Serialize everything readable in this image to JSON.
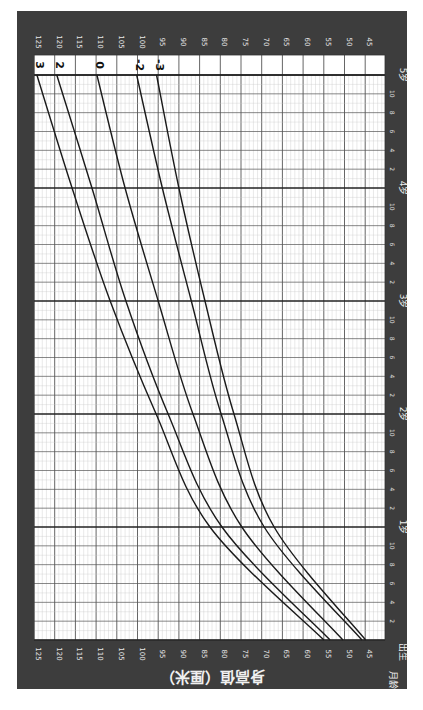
{
  "chart_data": {
    "type": "line",
    "title": "身高值（厘米）",
    "orientation": "rotated 90° clockwise (height axis horizontal, age axis vertical)",
    "xlabel": "月龄",
    "ylabel": "身高值（厘米）",
    "age_axis": {
      "start_label": "出生",
      "year_labels": [
        "1岁",
        "2岁",
        "3岁",
        "4岁",
        "5岁"
      ],
      "month_ticks": [
        "2",
        "4",
        "6",
        "8",
        "10"
      ],
      "range_months": [
        0,
        60
      ]
    },
    "height_axis": {
      "ticks": [
        125,
        120,
        115,
        110,
        105,
        100,
        95,
        90,
        85,
        80,
        75,
        70,
        65,
        60,
        55,
        50,
        45
      ],
      "range_cm": [
        45,
        125
      ]
    },
    "x": [
      0,
      12,
      24,
      36,
      48,
      60
    ],
    "x_unit": "months",
    "series": [
      {
        "name": "3",
        "values": [
          55.0,
          82.5,
          95.5,
          106.6,
          115.8,
          124.3
        ]
      },
      {
        "name": "2",
        "values": [
          53.5,
          79.6,
          92.6,
          102.8,
          111.0,
          119.5
        ]
      },
      {
        "name": "0",
        "values": [
          50.4,
          74.8,
          86.6,
          95.0,
          103.0,
          109.8
        ]
      },
      {
        "name": "-2",
        "values": [
          45.8,
          69.4,
          79.8,
          87.0,
          94.0,
          100.2
        ]
      },
      {
        "name": "-3",
        "values": [
          44.9,
          67.0,
          76.7,
          83.7,
          90.0,
          95.4
        ]
      }
    ],
    "grid": true,
    "legend_position": "curve labels at top end of each line"
  },
  "labels": {
    "title": "身高值（厘米）",
    "month_age": "月龄",
    "birth": "出生"
  },
  "colors": {
    "frame": "#3d3d3d",
    "grid_bg": "#ffffff",
    "minor_grid": "#c8c8c8",
    "major_grid": "#555555",
    "year_line": "#222222",
    "curve": "#1a1a1a"
  }
}
